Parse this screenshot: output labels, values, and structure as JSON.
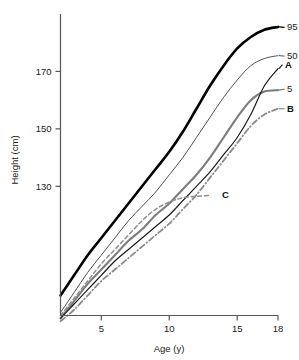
{
  "chart_data": {
    "type": "line",
    "title": "",
    "xlabel": "Age (y)",
    "ylabel": "Height (cm)",
    "xlim": [
      2,
      18
    ],
    "ylim": [
      85,
      190
    ],
    "xticks": [
      5,
      10,
      15,
      18
    ],
    "yticks": [
      130,
      150,
      170
    ],
    "xtick_labels": [
      "5",
      "10",
      "15",
      "18"
    ],
    "ytick_labels": [
      "130",
      "150",
      "170"
    ],
    "grid": false,
    "legend_position": "right-of-curve-ends",
    "series": [
      {
        "name": "95",
        "label": "95",
        "style": "solid",
        "color": "#000000",
        "width": 2.6,
        "points": [
          [
            2,
            92
          ],
          [
            3,
            99
          ],
          [
            4,
            106
          ],
          [
            5,
            112
          ],
          [
            6,
            118
          ],
          [
            7,
            124
          ],
          [
            8,
            130
          ],
          [
            9,
            136
          ],
          [
            10,
            142
          ],
          [
            11,
            149
          ],
          [
            12,
            157
          ],
          [
            13,
            165
          ],
          [
            14,
            172
          ],
          [
            15,
            178
          ],
          [
            16,
            182
          ],
          [
            17,
            184.5
          ],
          [
            18,
            185.5
          ]
        ]
      },
      {
        "name": "50",
        "label": "50",
        "style": "solid",
        "color": "#3b3b3b",
        "width": 0.9,
        "points": [
          [
            2,
            86
          ],
          [
            3,
            93
          ],
          [
            4,
            100
          ],
          [
            5,
            106
          ],
          [
            6,
            112
          ],
          [
            7,
            118
          ],
          [
            8,
            123
          ],
          [
            9,
            128
          ],
          [
            10,
            134
          ],
          [
            11,
            140
          ],
          [
            12,
            147
          ],
          [
            13,
            154
          ],
          [
            14,
            161
          ],
          [
            15,
            167
          ],
          [
            16,
            172
          ],
          [
            17,
            174.5
          ],
          [
            18,
            175.5
          ]
        ]
      },
      {
        "name": "5",
        "label": "5",
        "style": "solid",
        "color": "#7d7d7d",
        "width": 2.1,
        "points": [
          [
            2,
            84
          ],
          [
            3,
            90
          ],
          [
            4,
            96
          ],
          [
            5,
            101
          ],
          [
            6,
            106
          ],
          [
            7,
            111
          ],
          [
            8,
            115
          ],
          [
            9,
            120
          ],
          [
            10,
            124
          ],
          [
            11,
            129
          ],
          [
            12,
            134
          ],
          [
            13,
            140
          ],
          [
            14,
            147
          ],
          [
            15,
            154
          ],
          [
            16,
            160
          ],
          [
            17,
            163
          ],
          [
            18,
            163.5
          ]
        ]
      },
      {
        "name": "A",
        "label": "A",
        "style": "solid",
        "color": "#1c1c1c",
        "width": 1.2,
        "points": [
          [
            2,
            84
          ],
          [
            3,
            89
          ],
          [
            4,
            94
          ],
          [
            5,
            99
          ],
          [
            6,
            104
          ],
          [
            7,
            108
          ],
          [
            8,
            112
          ],
          [
            9,
            116
          ],
          [
            10,
            120
          ],
          [
            11,
            125
          ],
          [
            12,
            130
          ],
          [
            13,
            135
          ],
          [
            14,
            141
          ],
          [
            15,
            147
          ],
          [
            16,
            155
          ],
          [
            17,
            165
          ],
          [
            18,
            171
          ]
        ]
      },
      {
        "name": "B",
        "label": "B",
        "style": "dashdot",
        "color": "#8a8a8a",
        "width": 1.8,
        "points": [
          [
            2,
            83
          ],
          [
            3,
            87
          ],
          [
            4,
            92
          ],
          [
            5,
            97
          ],
          [
            6,
            101
          ],
          [
            7,
            105
          ],
          [
            8,
            109
          ],
          [
            9,
            113
          ],
          [
            10,
            117
          ],
          [
            11,
            122
          ],
          [
            12,
            127
          ],
          [
            13,
            133
          ],
          [
            14,
            139
          ],
          [
            15,
            145
          ],
          [
            16,
            151
          ],
          [
            17,
            155
          ],
          [
            18,
            157
          ]
        ]
      },
      {
        "name": "C",
        "label": "C",
        "style": "dashed",
        "color": "#8f8f8f",
        "width": 1.5,
        "points": [
          [
            2,
            85
          ],
          [
            3,
            91
          ],
          [
            4,
            97
          ],
          [
            5,
            103
          ],
          [
            6,
            108
          ],
          [
            7,
            113
          ],
          [
            8,
            118
          ],
          [
            9,
            122
          ],
          [
            10,
            124.5
          ],
          [
            11,
            126
          ],
          [
            12,
            126.5
          ],
          [
            13,
            126.8
          ]
        ]
      }
    ]
  },
  "axis": {
    "x_title": "Age (y)",
    "y_title": "Height (cm)"
  }
}
